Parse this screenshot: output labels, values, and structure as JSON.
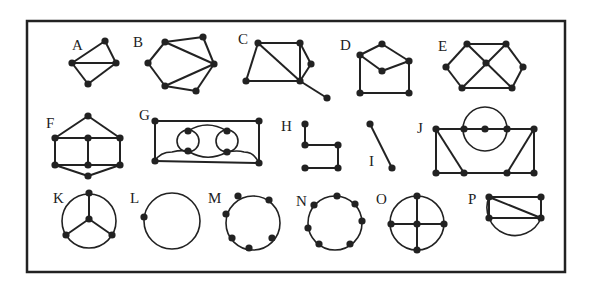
{
  "figure": {
    "frame": {
      "x": 27,
      "y": 21,
      "width": 538,
      "height": 251
    },
    "colors": {
      "ink": "#222222",
      "background": "#ffffff"
    },
    "graphs": [
      {
        "label": "A",
        "label_pos": [
          72,
          50
        ],
        "vertices": [
          [
            72,
            63
          ],
          [
            105,
            41
          ],
          [
            116,
            63
          ],
          [
            88,
            84
          ]
        ],
        "edges": [
          [
            0,
            1
          ],
          [
            1,
            2
          ],
          [
            0,
            2
          ],
          [
            0,
            3
          ],
          [
            3,
            2
          ]
        ],
        "curves": []
      },
      {
        "label": "B",
        "label_pos": [
          133,
          47
        ],
        "vertices": [
          [
            148,
            63
          ],
          [
            165,
            42
          ],
          [
            203,
            37
          ],
          [
            214,
            64
          ],
          [
            196,
            91
          ],
          [
            165,
            86
          ]
        ],
        "edges": [
          [
            0,
            1
          ],
          [
            1,
            2
          ],
          [
            2,
            3
          ],
          [
            1,
            3
          ],
          [
            3,
            4
          ],
          [
            4,
            5
          ],
          [
            5,
            3
          ],
          [
            5,
            0
          ]
        ],
        "curves": []
      },
      {
        "label": "C",
        "label_pos": [
          238,
          44
        ],
        "vertices": [
          [
            258,
            43
          ],
          [
            300,
            43
          ],
          [
            311,
            64
          ],
          [
            300,
            81
          ],
          [
            246,
            81
          ],
          [
            327,
            98
          ]
        ],
        "edges": [
          [
            0,
            1
          ],
          [
            1,
            3
          ],
          [
            1,
            2
          ],
          [
            2,
            3
          ],
          [
            0,
            3
          ],
          [
            0,
            4
          ],
          [
            4,
            3
          ],
          [
            3,
            5
          ]
        ],
        "curves": []
      },
      {
        "label": "D",
        "label_pos": [
          340,
          50
        ],
        "vertices": [
          [
            382,
            44
          ],
          [
            360,
            55
          ],
          [
            409,
            61
          ],
          [
            382,
            71
          ],
          [
            360,
            93
          ],
          [
            409,
            93
          ]
        ],
        "edges": [
          [
            0,
            1
          ],
          [
            0,
            2
          ],
          [
            1,
            3
          ],
          [
            3,
            2
          ],
          [
            1,
            4
          ],
          [
            4,
            5
          ],
          [
            5,
            2
          ]
        ],
        "curves": []
      },
      {
        "label": "E",
        "label_pos": [
          438,
          51
        ],
        "vertices": [
          [
            467,
            44
          ],
          [
            506,
            44
          ],
          [
            446,
            67
          ],
          [
            486,
            63
          ],
          [
            523,
            67
          ],
          [
            462,
            88
          ],
          [
            512,
            88
          ]
        ],
        "edges": [
          [
            0,
            1
          ],
          [
            0,
            2
          ],
          [
            2,
            5
          ],
          [
            5,
            6
          ],
          [
            6,
            4
          ],
          [
            4,
            1
          ],
          [
            0,
            6
          ],
          [
            1,
            5
          ]
        ],
        "curves": []
      },
      {
        "label": "F",
        "label_pos": [
          46,
          128
        ],
        "vertices": [
          [
            88,
            116
          ],
          [
            55,
            138
          ],
          [
            88,
            138
          ],
          [
            120,
            138
          ],
          [
            55,
            165
          ],
          [
            88,
            165
          ],
          [
            120,
            165
          ],
          [
            88,
            176
          ]
        ],
        "edges": [
          [
            0,
            1
          ],
          [
            0,
            3
          ],
          [
            1,
            2
          ],
          [
            2,
            3
          ],
          [
            1,
            4
          ],
          [
            3,
            6
          ],
          [
            2,
            5
          ],
          [
            4,
            5
          ],
          [
            5,
            6
          ],
          [
            4,
            7
          ],
          [
            7,
            6
          ]
        ],
        "curves": []
      },
      {
        "label": "G",
        "label_pos": [
          139,
          120
        ],
        "vertices": [
          [
            155,
            121
          ],
          [
            259,
            121
          ],
          [
            155,
            161
          ],
          [
            259,
            163
          ],
          [
            188,
            131
          ],
          [
            188,
            151
          ],
          [
            227,
            131
          ],
          [
            227,
            152
          ]
        ],
        "edges": [
          [
            0,
            1
          ],
          [
            0,
            2
          ],
          [
            1,
            3
          ],
          [
            2,
            3
          ]
        ],
        "curves": [
          {
            "type": "circle",
            "cx": 188,
            "cy": 141,
            "r": 11
          },
          {
            "type": "circle",
            "cx": 227,
            "cy": 141,
            "r": 11
          },
          {
            "type": "path",
            "d": "M188,131 Q207,119 227,131"
          },
          {
            "type": "path",
            "d": "M188,151 Q207,163 227,152"
          },
          {
            "type": "path",
            "d": "M155,161 Q160,152 172,152 Q180,150 188,151"
          },
          {
            "type": "path",
            "d": "M227,152 Q238,150 244,152 Q254,152 259,163"
          }
        ]
      },
      {
        "label": "H",
        "label_pos": [
          281,
          131
        ],
        "vertices": [
          [
            305,
            124
          ],
          [
            305,
            145
          ],
          [
            338,
            145
          ],
          [
            305,
            168
          ],
          [
            338,
            168
          ]
        ],
        "edges": [
          [
            0,
            1
          ],
          [
            1,
            2
          ],
          [
            2,
            4
          ],
          [
            3,
            4
          ]
        ],
        "curves": []
      },
      {
        "label": "I",
        "label_pos": [
          369,
          166
        ],
        "vertices": [
          [
            370,
            124
          ],
          [
            392,
            168
          ]
        ],
        "edges": [
          [
            0,
            1
          ]
        ],
        "curves": []
      },
      {
        "label": "J",
        "label_pos": [
          417,
          133
        ],
        "vertices": [
          [
            436,
            129
          ],
          [
            464,
            129
          ],
          [
            485,
            129
          ],
          [
            507,
            129
          ],
          [
            534,
            129
          ],
          [
            436,
            173
          ],
          [
            464,
            173
          ],
          [
            507,
            173
          ],
          [
            534,
            173
          ]
        ],
        "edges": [
          [
            0,
            1
          ],
          [
            1,
            2
          ],
          [
            2,
            3
          ],
          [
            3,
            4
          ],
          [
            0,
            5
          ],
          [
            0,
            6
          ],
          [
            5,
            6
          ],
          [
            6,
            7
          ],
          [
            7,
            8
          ],
          [
            4,
            7
          ],
          [
            4,
            8
          ]
        ],
        "curves": [
          {
            "type": "circle",
            "cx": 485,
            "cy": 129,
            "r": 22
          }
        ]
      },
      {
        "label": "K",
        "label_pos": [
          53,
          203
        ],
        "vertices": [
          [
            89,
            193
          ],
          [
            89,
            219
          ],
          [
            66,
            235
          ],
          [
            112,
            235
          ]
        ],
        "edges": [
          [
            0,
            1
          ],
          [
            1,
            2
          ],
          [
            1,
            3
          ]
        ],
        "curves": [
          {
            "type": "circle",
            "cx": 89,
            "cy": 221,
            "r": 27
          }
        ]
      },
      {
        "label": "L",
        "label_pos": [
          130,
          203
        ],
        "vertices": [
          [
            144,
            217
          ]
        ],
        "edges": [],
        "curves": [
          {
            "type": "circle",
            "cx": 172,
            "cy": 221,
            "r": 28
          }
        ]
      },
      {
        "label": "M",
        "label_pos": [
          208,
          203
        ],
        "vertices": [
          [
            238,
            196
          ],
          [
            269,
            200
          ],
          [
            226,
            214
          ],
          [
            232,
            238
          ],
          [
            249,
            248
          ],
          [
            272,
            238
          ]
        ],
        "edges": [],
        "curves": [
          {
            "type": "circle",
            "cx": 253,
            "cy": 223,
            "r": 27
          }
        ]
      },
      {
        "label": "N",
        "label_pos": [
          296,
          206
        ],
        "vertices": [
          [
            337,
            196
          ],
          [
            314,
            205
          ],
          [
            355,
            204
          ],
          [
            362,
            221
          ],
          [
            308,
            228
          ],
          [
            319,
            244
          ],
          [
            350,
            244
          ]
        ],
        "edges": [],
        "curves": [
          {
            "type": "circle",
            "cx": 335,
            "cy": 223,
            "r": 27
          }
        ]
      },
      {
        "label": "O",
        "label_pos": [
          376,
          204
        ],
        "vertices": [
          [
            417,
            196
          ],
          [
            391,
            224
          ],
          [
            417,
            224
          ],
          [
            444,
            224
          ],
          [
            417,
            250
          ]
        ],
        "edges": [
          [
            0,
            4
          ],
          [
            1,
            3
          ]
        ],
        "curves": [
          {
            "type": "circle",
            "cx": 417,
            "cy": 223,
            "r": 27
          }
        ]
      },
      {
        "label": "P",
        "label_pos": [
          468,
          204
        ],
        "vertices": [
          [
            489,
            197
          ],
          [
            541,
            197
          ],
          [
            489,
            218
          ],
          [
            541,
            218
          ]
        ],
        "edges": [
          [
            0,
            1
          ],
          [
            1,
            3
          ],
          [
            2,
            3
          ],
          [
            0,
            2
          ],
          [
            0,
            3
          ]
        ],
        "curves": [
          {
            "type": "path",
            "d": "M489,197 A28,28 0 1,0 541,218"
          }
        ]
      }
    ]
  }
}
